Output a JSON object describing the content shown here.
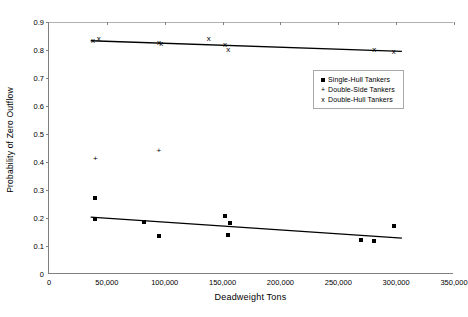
{
  "chart_data": {
    "type": "scatter",
    "title": "",
    "xlabel": "Deadweight Tons",
    "ylabel": "Probability of Zero Outflow",
    "xlim": [
      0,
      350000
    ],
    "ylim": [
      0,
      0.9
    ],
    "grid": false,
    "legend_position": "center-right",
    "x_ticks": [
      0,
      50000,
      100000,
      150000,
      200000,
      250000,
      300000,
      350000
    ],
    "x_tick_labels": [
      "0",
      "50,000",
      "100,000",
      "150,000",
      "200,000",
      "250,000",
      "300,000",
      "350,000"
    ],
    "y_ticks": [
      0,
      0.1,
      0.2,
      0.3,
      0.4,
      0.5,
      0.6,
      0.7,
      0.8,
      0.9
    ],
    "y_tick_labels": [
      "0",
      "0.1",
      "0.2",
      "0.3",
      "0.4",
      "0.5",
      "0.6",
      "0.7",
      "0.8",
      "0.9"
    ],
    "series": [
      {
        "name": "Single-Hull Tankers",
        "marker": "square",
        "points": [
          {
            "x": 40000,
            "y": 0.27
          },
          {
            "x": 40000,
            "y": 0.196
          },
          {
            "x": 82000,
            "y": 0.186
          },
          {
            "x": 95000,
            "y": 0.137
          },
          {
            "x": 152000,
            "y": 0.208
          },
          {
            "x": 156000,
            "y": 0.183
          },
          {
            "x": 155000,
            "y": 0.139
          },
          {
            "x": 270000,
            "y": 0.123
          },
          {
            "x": 281000,
            "y": 0.118
          },
          {
            "x": 298000,
            "y": 0.17
          }
        ]
      },
      {
        "name": "Double-Side Tankers",
        "marker": "plus",
        "points": [
          {
            "x": 40000,
            "y": 0.412
          },
          {
            "x": 95000,
            "y": 0.44
          }
        ]
      },
      {
        "name": "Double-Hull Tankers",
        "marker": "x",
        "points": [
          {
            "x": 38000,
            "y": 0.832
          },
          {
            "x": 43000,
            "y": 0.84
          },
          {
            "x": 95000,
            "y": 0.824
          },
          {
            "x": 97000,
            "y": 0.82
          },
          {
            "x": 138000,
            "y": 0.84
          },
          {
            "x": 152000,
            "y": 0.818
          },
          {
            "x": 155000,
            "y": 0.8
          },
          {
            "x": 281000,
            "y": 0.8
          },
          {
            "x": 298000,
            "y": 0.794
          }
        ]
      }
    ],
    "trend_lines": [
      {
        "for": "Double-Hull Tankers",
        "x_start": 36000,
        "y_start": 0.833,
        "x_end": 305000,
        "y_end": 0.795
      },
      {
        "for": "Single-Hull Tankers",
        "x_start": 36000,
        "y_start": 0.203,
        "x_end": 305000,
        "y_end": 0.128
      }
    ]
  },
  "legend": {
    "items": [
      {
        "label": "Single-Hull Tankers",
        "glyph": "square-marker-icon",
        "symbol": ""
      },
      {
        "label": "Double-Side Tankers",
        "glyph": "plus-marker-icon",
        "symbol": "+"
      },
      {
        "label": "Double-Hull Tankers",
        "glyph": "x-marker-icon",
        "symbol": "x"
      }
    ]
  }
}
